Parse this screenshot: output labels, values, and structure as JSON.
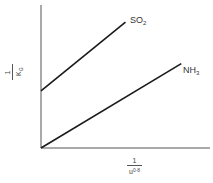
{
  "chart_data": {
    "type": "line",
    "title": "",
    "xlabel": "1 / u^0.8",
    "ylabel": "1 / K_G",
    "xlim": [
      0,
      10
    ],
    "ylim": [
      0,
      10
    ],
    "grid": false,
    "legend": "inline labels at line ends",
    "ticks": "none",
    "series": [
      {
        "name": "SO2",
        "x": [
          0,
          5.0
        ],
        "y": [
          4.0,
          8.8
        ],
        "label_sub": "2",
        "label_main": "SO"
      },
      {
        "name": "NH3",
        "x": [
          0,
          8.3
        ],
        "y": [
          0,
          5.9
        ],
        "label_sub": "3",
        "label_main": "NH"
      }
    ]
  },
  "labels": {
    "x_num": "1",
    "x_den_base": "u",
    "x_den_exp": "0·8",
    "y_num": "1",
    "y_den_base": "K",
    "y_den_sub": "G"
  },
  "colors": {
    "line": "#1a1a1a",
    "axis": "#555555"
  }
}
